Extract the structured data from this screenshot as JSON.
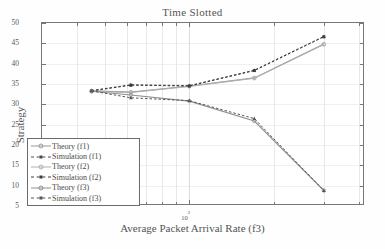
{
  "chart_data": {
    "type": "line",
    "title": "Time Slotted",
    "xlabel": "Average Packet Arrival Rate (f3)",
    "ylabel": "Strategy",
    "xscale": "log",
    "xtick_labels": [
      "10",
      "2"
    ],
    "xtick_label_full": "10^2",
    "ylim": [
      5,
      50
    ],
    "ytick_labels": [
      "50",
      "45",
      "40",
      "35",
      "30",
      "25",
      "20",
      "15",
      "10",
      "5"
    ],
    "ytick_values": [
      50,
      45,
      40,
      35,
      30,
      25,
      20,
      15,
      10,
      5
    ],
    "grid": true,
    "legend_position": "lower-left",
    "x": [
      45,
      62,
      100,
      170,
      300
    ],
    "series": [
      {
        "name": "Theory (f1)",
        "style": "solid",
        "marker": "circle",
        "color": "#9a9a9a",
        "values": [
          33.3,
          33.0,
          34.5,
          36.5,
          44.8
        ]
      },
      {
        "name": "Simulation (f1)",
        "style": "dashed",
        "marker": "triangle",
        "color": "#4a4a4a",
        "values": [
          33.4,
          34.8,
          34.6,
          38.4,
          46.7
        ]
      },
      {
        "name": "Theory (f2)",
        "style": "solid",
        "marker": "circle",
        "color": "#b0b0b0",
        "values": [
          33.2,
          32.9,
          34.4,
          36.4,
          44.7
        ]
      },
      {
        "name": "Simulation (f2)",
        "style": "dashed",
        "marker": "square",
        "color": "#3d3d3d",
        "values": [
          33.3,
          34.7,
          34.5,
          38.3,
          46.6
        ]
      },
      {
        "name": "Theory (f3)",
        "style": "solid",
        "marker": "circle",
        "color": "#8f8f8f",
        "values": [
          33.2,
          32.3,
          30.8,
          25.9,
          8.8
        ]
      },
      {
        "name": "Simulation (f3)",
        "style": "dashed",
        "marker": "triangle",
        "color": "#555555",
        "values": [
          33.3,
          31.6,
          30.9,
          26.5,
          8.8
        ]
      }
    ]
  },
  "legend": {
    "items": [
      {
        "label": "Theory (f1)"
      },
      {
        "label": "Simulation (f1)"
      },
      {
        "label": "Theory (f2)"
      },
      {
        "label": "Simulation (f2)"
      },
      {
        "label": "Theory (f3)"
      },
      {
        "label": "Simulation (f3)"
      }
    ]
  }
}
